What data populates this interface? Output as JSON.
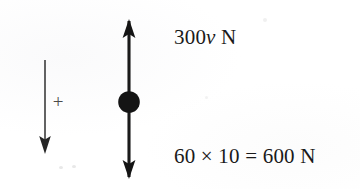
{
  "figure": {
    "type": "free-body-force-diagram",
    "title": "",
    "background_color": "#ffffff",
    "ink_color": "#1a1a1a"
  },
  "direction_convention": {
    "arrow_name": "downward-positive-direction-arrow",
    "arrow_direction": "down",
    "sign_label": "+"
  },
  "particle": {
    "name": "particle-mass-dot",
    "shape": "filled-circle",
    "color": "#141414"
  },
  "forces": [
    {
      "name": "upward-force",
      "direction": "up",
      "label_prefix": "300",
      "label_variable": "v",
      "label_unit": " N",
      "label_full": "300v N"
    },
    {
      "name": "downward-weight-force",
      "direction": "down",
      "label_full": "60 × 10 = 600 N",
      "mass": "60",
      "gravity": "10",
      "result": "600",
      "unit": "N"
    }
  ],
  "labels": {
    "upper_prefix": "300",
    "upper_variable": "v",
    "upper_unit": " N",
    "lower": "60 × 10 = 600 N"
  }
}
